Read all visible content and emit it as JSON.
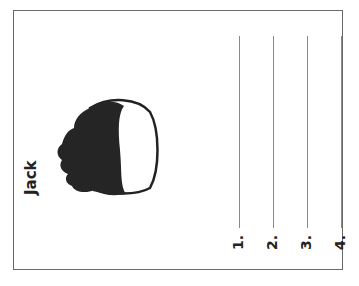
{
  "worksheet": {
    "orientation": "rotated-90-ccw",
    "title": "Jack",
    "image": "head-silhouette-profile",
    "answer_lines": [
      {
        "label": "1."
      },
      {
        "label": "2."
      },
      {
        "label": "3."
      },
      {
        "label": "4."
      }
    ]
  }
}
